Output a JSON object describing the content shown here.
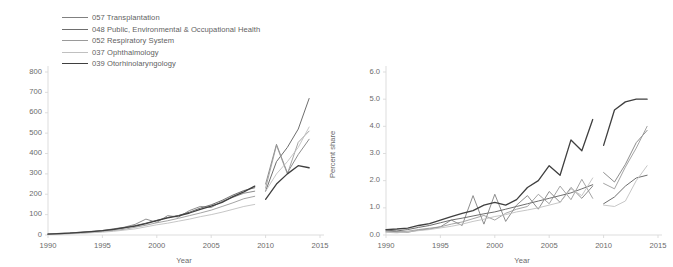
{
  "figure": {
    "background": "#ffffff",
    "text_color": "#6a6a6a"
  },
  "legend": {
    "position": "top-left",
    "entries": [
      {
        "code": "057",
        "label": "057 Transplantation",
        "color": "#808080",
        "width": 0.9
      },
      {
        "code": "048",
        "label": "048 Public, Environmental & Occupational Health",
        "color": "#6e6e6e",
        "width": 1.0
      },
      {
        "code": "052",
        "label": "052 Respiratory System",
        "color": "#9a9a9a",
        "width": 0.9
      },
      {
        "code": "037",
        "label": "037 Ophthalmology",
        "color": "#c0c0c0",
        "width": 0.9
      },
      {
        "code": "039",
        "label": "039 Otorhinolaryngology",
        "color": "#3f3f3f",
        "width": 1.3
      }
    ]
  },
  "chart_data": [
    {
      "id": "left",
      "type": "line",
      "title": "",
      "xlabel": "Year",
      "ylabel": "No. of articles",
      "xlim": [
        1990,
        2015
      ],
      "ylim": [
        0,
        800
      ],
      "xticks": [
        1990,
        1995,
        2000,
        2005,
        2010,
        2015
      ],
      "xtick_labels": [
        "1990",
        "1995",
        "2000",
        "2005",
        "2010",
        "2015"
      ],
      "yticks": [
        0,
        100,
        200,
        300,
        400,
        500,
        600,
        700,
        800
      ],
      "ytick_labels": [
        "0",
        "100",
        "200",
        "300",
        "400",
        "500",
        "600",
        "700",
        "800"
      ],
      "grid": false,
      "legend_position": "external-top-left",
      "note": "series are split into two segments with a data gap between 2009 and 2010",
      "series": [
        {
          "name": "057 Transplantation",
          "color": "#808080",
          "width": 0.9,
          "segments": [
            {
              "x": [
                1990,
                1991,
                1992,
                1993,
                1994,
                1995,
                1996,
                1997,
                1998,
                1999,
                2000,
                2001,
                2002,
                2003,
                2004,
                2005,
                2006,
                2007,
                2008,
                2009
              ],
              "y": [
                5,
                8,
                10,
                14,
                18,
                22,
                30,
                38,
                52,
                78,
                62,
                95,
                88,
                120,
                140,
                135,
                165,
                185,
                205,
                215
              ]
            },
            {
              "x": [
                2010,
                2011,
                2012,
                2013,
                2014
              ],
              "y": [
                250,
                445,
                305,
                395,
                470
              ]
            }
          ]
        },
        {
          "name": "048 Public, Environmental & Occupational Health",
          "color": "#6e6e6e",
          "width": 1.0,
          "segments": [
            {
              "x": [
                1990,
                1991,
                1992,
                1993,
                1994,
                1995,
                1996,
                1997,
                1998,
                1999,
                2000,
                2001,
                2002,
                2003,
                2004,
                2005,
                2006,
                2007,
                2008,
                2009
              ],
              "y": [
                4,
                6,
                9,
                12,
                16,
                20,
                26,
                34,
                46,
                58,
                72,
                86,
                96,
                112,
                132,
                148,
                170,
                196,
                218,
                232
              ]
            },
            {
              "x": [
                2010,
                2011,
                2012,
                2013,
                2014
              ],
              "y": [
                215,
                360,
                430,
                520,
                670
              ]
            }
          ]
        },
        {
          "name": "052 Respiratory System",
          "color": "#9a9a9a",
          "width": 0.9,
          "segments": [
            {
              "x": [
                1990,
                1991,
                1992,
                1993,
                1994,
                1995,
                1996,
                1997,
                1998,
                1999,
                2000,
                2001,
                2002,
                2003,
                2004,
                2005,
                2006,
                2007,
                2008,
                2009
              ],
              "y": [
                3,
                5,
                7,
                10,
                13,
                17,
                22,
                28,
                38,
                48,
                60,
                70,
                82,
                95,
                108,
                122,
                140,
                158,
                178,
                190
              ]
            },
            {
              "x": [
                2010,
                2011,
                2012,
                2013,
                2014
              ],
              "y": [
                230,
                440,
                300,
                455,
                510
              ]
            }
          ]
        },
        {
          "name": "037 Ophthalmology",
          "color": "#c0c0c0",
          "width": 0.9,
          "segments": [
            {
              "x": [
                1990,
                1991,
                1992,
                1993,
                1994,
                1995,
                1996,
                1997,
                1998,
                1999,
                2000,
                2001,
                2002,
                2003,
                2004,
                2005,
                2006,
                2007,
                2008,
                2009
              ],
              "y": [
                3,
                4,
                6,
                8,
                11,
                14,
                18,
                24,
                30,
                40,
                50,
                58,
                68,
                78,
                90,
                100,
                112,
                126,
                140,
                150
              ]
            },
            {
              "x": [
                2010,
                2011,
                2012,
                2013,
                2014
              ],
              "y": [
                215,
                300,
                360,
                430,
                530
              ]
            }
          ]
        },
        {
          "name": "039 Otorhinolaryngology",
          "color": "#3f3f3f",
          "width": 1.3,
          "segments": [
            {
              "x": [
                1990,
                1991,
                1992,
                1993,
                1994,
                1995,
                1996,
                1997,
                1998,
                1999,
                2000,
                2001,
                2002,
                2003,
                2004,
                2005,
                2006,
                2007,
                2008,
                2009
              ],
              "y": [
                4,
                7,
                9,
                13,
                17,
                21,
                28,
                36,
                44,
                56,
                70,
                84,
                94,
                108,
                126,
                142,
                160,
                188,
                212,
                240
              ]
            },
            {
              "x": [
                2010,
                2011,
                2012,
                2013,
                2014
              ],
              "y": [
                175,
                250,
                300,
                340,
                330
              ]
            }
          ]
        }
      ]
    },
    {
      "id": "right",
      "type": "line",
      "title": "",
      "xlabel": "Year",
      "ylabel": "Percent share",
      "xlim": [
        1990,
        2015
      ],
      "ylim": [
        0,
        6
      ],
      "xticks": [
        1990,
        1995,
        2000,
        2005,
        2010,
        2015
      ],
      "xtick_labels": [
        "1990",
        "1995",
        "2000",
        "2005",
        "2010",
        "2015"
      ],
      "yticks": [
        0,
        1,
        2,
        3,
        4,
        5,
        6
      ],
      "ytick_labels": [
        "0.0",
        "1.0",
        "2.0",
        "3.0",
        "4.0",
        "5.0",
        "6.0"
      ],
      "grid": false,
      "legend_position": "shared-with-left-panel",
      "note": "series are split into two segments with a data gap between 2009 and 2010",
      "series": [
        {
          "name": "057 Transplantation",
          "color": "#808080",
          "width": 0.9,
          "segments": [
            {
              "x": [
                1990,
                1991,
                1992,
                1993,
                1994,
                1995,
                1996,
                1997,
                1998,
                1999,
                2000,
                2001,
                2002,
                2003,
                2004,
                2005,
                2006,
                2007,
                2008,
                2009
              ],
              "y": [
                0.15,
                0.12,
                0.1,
                0.18,
                0.22,
                0.3,
                0.55,
                0.35,
                1.45,
                0.4,
                1.5,
                0.5,
                1.1,
                1.45,
                0.95,
                1.6,
                1.2,
                1.75,
                1.35,
                1.8
              ]
            },
            {
              "x": [
                2010,
                2011,
                2012,
                2013,
                2014
              ],
              "y": [
                2.3,
                1.95,
                2.6,
                3.4,
                3.85
              ]
            }
          ]
        },
        {
          "name": "048 Public, Environmental & Occupational Health",
          "color": "#6e6e6e",
          "width": 1.0,
          "segments": [
            {
              "x": [
                1990,
                1991,
                1992,
                1993,
                1994,
                1995,
                1996,
                1997,
                1998,
                1999,
                2000,
                2001,
                2002,
                2003,
                2004,
                2005,
                2006,
                2007,
                2008,
                2009
              ],
              "y": [
                0.18,
                0.15,
                0.2,
                0.28,
                0.35,
                0.45,
                0.55,
                0.62,
                0.7,
                0.78,
                0.85,
                0.95,
                1.05,
                1.15,
                1.25,
                1.35,
                1.45,
                1.55,
                1.7,
                1.85
              ]
            },
            {
              "x": [
                2010,
                2011,
                2012,
                2013,
                2014
              ],
              "y": [
                1.15,
                1.4,
                1.8,
                2.1,
                2.2
              ]
            }
          ]
        },
        {
          "name": "052 Respiratory System",
          "color": "#9a9a9a",
          "width": 0.9,
          "segments": [
            {
              "x": [
                1990,
                1991,
                1992,
                1993,
                1994,
                1995,
                1996,
                1997,
                1998,
                1999,
                2000,
                2001,
                2002,
                2003,
                2004,
                2005,
                2006,
                2007,
                2008,
                2009
              ],
              "y": [
                0.12,
                0.1,
                0.14,
                0.2,
                0.25,
                0.3,
                0.4,
                0.48,
                0.6,
                0.72,
                0.55,
                0.8,
                0.95,
                1.05,
                1.5,
                1.15,
                1.8,
                1.3,
                2.05,
                1.35
              ]
            },
            {
              "x": [
                2010,
                2011,
                2012,
                2013,
                2014
              ],
              "y": [
                1.9,
                1.7,
                2.5,
                3.2,
                4.0
              ]
            }
          ]
        },
        {
          "name": "037 Ophthalmology",
          "color": "#c0c0c0",
          "width": 0.9,
          "segments": [
            {
              "x": [
                1990,
                1991,
                1992,
                1993,
                1994,
                1995,
                1996,
                1997,
                1998,
                1999,
                2000,
                2001,
                2002,
                2003,
                2004,
                2005,
                2006,
                2007,
                2008,
                2009
              ],
              "y": [
                0.1,
                0.08,
                0.12,
                0.16,
                0.2,
                0.26,
                0.32,
                0.4,
                0.5,
                0.58,
                0.68,
                0.75,
                0.85,
                0.92,
                1.0,
                1.1,
                1.2,
                1.7,
                1.45,
                2.1
              ]
            },
            {
              "x": [
                2010,
                2011,
                2012,
                2013,
                2014
              ],
              "y": [
                1.1,
                1.05,
                1.25,
                2.0,
                2.55
              ]
            }
          ]
        },
        {
          "name": "039 Otorhinolaryngology",
          "color": "#3f3f3f",
          "width": 1.3,
          "segments": [
            {
              "x": [
                1990,
                1991,
                1992,
                1993,
                1994,
                1995,
                1996,
                1997,
                1998,
                1999,
                2000,
                2001,
                2002,
                2003,
                2004,
                2005,
                2006,
                2007,
                2008,
                2009
              ],
              "y": [
                0.2,
                0.22,
                0.25,
                0.35,
                0.42,
                0.55,
                0.68,
                0.8,
                0.9,
                1.1,
                1.2,
                1.1,
                1.3,
                1.75,
                2.0,
                2.55,
                2.2,
                3.5,
                3.1,
                4.25
              ]
            },
            {
              "x": [
                2010,
                2011,
                2012,
                2013,
                2014
              ],
              "y": [
                3.3,
                4.6,
                4.9,
                5.0,
                5.0
              ]
            }
          ]
        }
      ]
    }
  ]
}
